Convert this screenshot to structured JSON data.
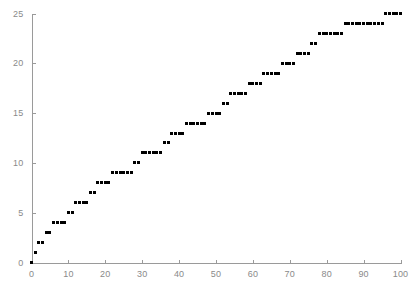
{
  "chart_data": {
    "type": "scatter",
    "title": "",
    "xlabel": "",
    "ylabel": "",
    "xlim": [
      0,
      100
    ],
    "ylim": [
      0,
      25
    ],
    "grid": false,
    "legend": null,
    "marker": {
      "shape": "square",
      "color": "#000000",
      "size_px": 3
    },
    "axis_color": "#9a9a9a",
    "tick_label_color": "#8a8a8a",
    "xticks": [
      0,
      10,
      20,
      30,
      40,
      50,
      60,
      70,
      80,
      90,
      100
    ],
    "xticklabels": [
      "0",
      "10",
      "20",
      "30",
      "40",
      "50",
      "60",
      "70",
      "80",
      "90",
      "100"
    ],
    "yticks": [
      0,
      5,
      10,
      15,
      20,
      25
    ],
    "yticklabels": [
      "0",
      "5",
      "10",
      "15",
      "20",
      "25"
    ],
    "x": [
      0,
      1,
      2,
      3,
      4,
      5,
      6,
      7,
      8,
      9,
      10,
      11,
      12,
      13,
      14,
      15,
      16,
      17,
      18,
      19,
      20,
      21,
      22,
      23,
      24,
      25,
      26,
      27,
      28,
      29,
      30,
      31,
      32,
      33,
      34,
      35,
      36,
      37,
      38,
      39,
      40,
      41,
      42,
      43,
      44,
      45,
      46,
      47,
      48,
      49,
      50,
      51,
      52,
      53,
      54,
      55,
      56,
      57,
      58,
      59,
      60,
      61,
      62,
      63,
      64,
      65,
      66,
      67,
      68,
      69,
      70,
      71,
      72,
      73,
      74,
      75,
      76,
      77,
      78,
      79,
      80,
      81,
      82,
      83,
      84,
      85,
      86,
      87,
      88,
      89,
      90,
      91,
      92,
      93,
      94,
      95,
      96,
      97,
      98,
      99,
      100
    ],
    "y": [
      0,
      1,
      2,
      2,
      3,
      3,
      4,
      4,
      4,
      4,
      5,
      5,
      6,
      6,
      6,
      6,
      7,
      7,
      8,
      8,
      8,
      8,
      9,
      9,
      9,
      9,
      9,
      9,
      10,
      10,
      11,
      11,
      11,
      11,
      11,
      11,
      12,
      12,
      13,
      13,
      13,
      13,
      14,
      14,
      14,
      14,
      14,
      14,
      15,
      15,
      15,
      15,
      16,
      16,
      17,
      17,
      17,
      17,
      17,
      18,
      18,
      18,
      18,
      19,
      19,
      19,
      19,
      19,
      20,
      20,
      20,
      20,
      21,
      21,
      21,
      21,
      22,
      22,
      23,
      23,
      23,
      23,
      23,
      23,
      23,
      24,
      24,
      24,
      24,
      24,
      24,
      24,
      24,
      24,
      24,
      24,
      25,
      25,
      25,
      25,
      25
    ]
  }
}
